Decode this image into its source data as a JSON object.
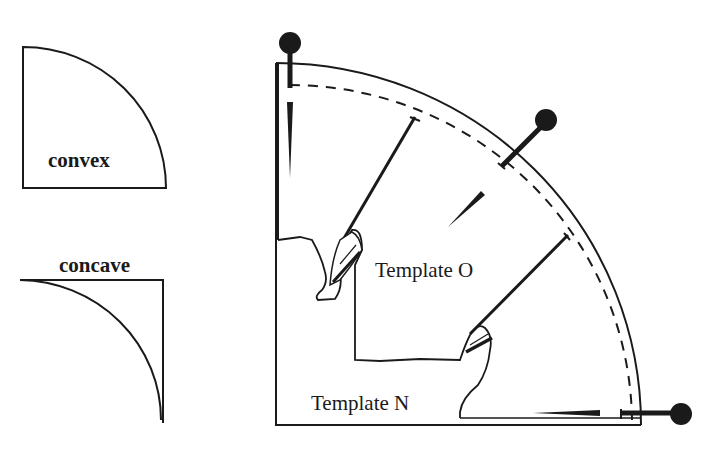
{
  "labels": {
    "convex": "convex",
    "concave": "concave",
    "template_o": "Template O",
    "template_n": "Template N"
  },
  "colors": {
    "ink": "#1a1a1a",
    "background": "#ffffff"
  },
  "elements": {
    "convex_shape": "quarter-circle convex template outline",
    "concave_shape": "quarter-circle concave template outline",
    "main_drawing": "quarter-circle template with pins, dashed guide arc and two nested templates",
    "pins": [
      "pin-top",
      "pin-middle",
      "pin-bottom-right"
    ],
    "needles": [
      "needle-top-left",
      "needle-middle",
      "needle-bottom"
    ],
    "pencils": [
      "pencil-upper",
      "pencil-lower"
    ]
  }
}
